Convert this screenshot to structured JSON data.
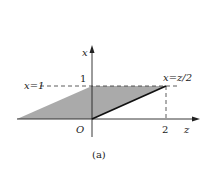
{
  "diagram": {
    "caption": "(a)",
    "axes": {
      "vertical_label": "x",
      "horizontal_label": "z",
      "origin_label": "O"
    },
    "ticks": {
      "x_tick": "1",
      "z_tick": "2"
    },
    "annotations": {
      "horizontal_line_label": "x=1",
      "slanted_line_label": "x=z/2"
    },
    "colors": {
      "shade": "#aaaaaa",
      "line": "#222222"
    }
  }
}
